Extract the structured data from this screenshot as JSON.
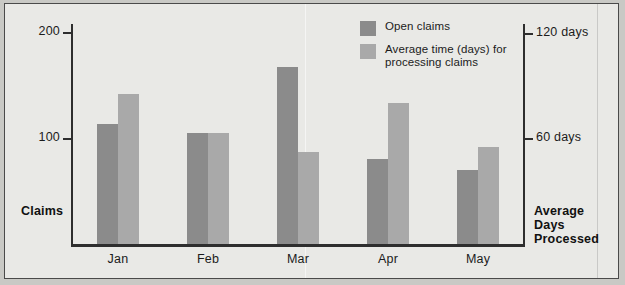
{
  "chart_data": {
    "type": "bar",
    "title": "",
    "categories": [
      "Jan",
      "Feb",
      "Mar",
      "Apr",
      "May"
    ],
    "series": [
      {
        "name": "Open claims",
        "axis": "left",
        "color": "#8b8b8b",
        "values": [
          113,
          105,
          167,
          80,
          70
        ]
      },
      {
        "name": "Average time (days) for processing claims",
        "axis": "right",
        "color": "#a9a9a9",
        "values": [
          85,
          63,
          52,
          80,
          55
        ]
      }
    ],
    "left_axis": {
      "label": "Claims",
      "ticks": [
        100,
        200
      ],
      "tick_labels": [
        "100",
        "200"
      ],
      "lim": [
        0,
        208
      ]
    },
    "right_axis": {
      "label": "Average Days Processed",
      "ticks": [
        60,
        120
      ],
      "tick_labels": [
        "60 days",
        "120 days"
      ],
      "lim": [
        0,
        125
      ]
    },
    "xlabel": "",
    "grid": false,
    "legend_position": "top-center"
  },
  "legend": {
    "items": [
      {
        "label": "Open claims",
        "color": "#8b8b8b"
      },
      {
        "label": "Average time (days) for processing claims",
        "color": "#a9a9a9"
      }
    ]
  },
  "axis_titles": {
    "left": "Claims",
    "right_line1": "Average Days",
    "right_line2": "Processed"
  },
  "ticks": {
    "left": [
      {
        "value": 200,
        "label": "200"
      },
      {
        "value": 100,
        "label": "100"
      }
    ],
    "right": [
      {
        "value": 120,
        "label": "120 days"
      },
      {
        "value": 60,
        "label": "60 days"
      }
    ]
  }
}
